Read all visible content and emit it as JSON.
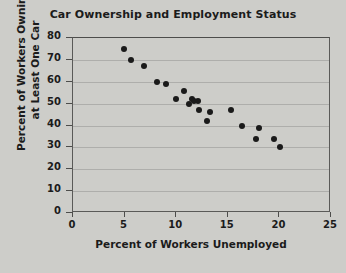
{
  "chart_data": {
    "type": "scatter",
    "title": "Car Ownership and Employment Status",
    "xlabel": "Percent of Workers Unemployed",
    "ylabel_line1": "Percent of Workers Owning",
    "ylabel_line2": "at Least One Car",
    "xlim": [
      0,
      25
    ],
    "ylim": [
      0,
      80
    ],
    "xticks": [
      0,
      5,
      10,
      15,
      20,
      25
    ],
    "yticks": [
      0,
      10,
      20,
      30,
      40,
      50,
      60,
      70,
      80
    ],
    "grid": "horizontal-faint",
    "legend": null,
    "marker": {
      "shape": "circle",
      "color": "#1a1a1a",
      "size_px": 6
    },
    "points": [
      {
        "x": 4.9,
        "y": 75
      },
      {
        "x": 5.6,
        "y": 70
      },
      {
        "x": 6.9,
        "y": 67
      },
      {
        "x": 8.1,
        "y": 60
      },
      {
        "x": 9.0,
        "y": 59
      },
      {
        "x": 10.0,
        "y": 52
      },
      {
        "x": 10.8,
        "y": 56
      },
      {
        "x": 11.2,
        "y": 50
      },
      {
        "x": 11.5,
        "y": 52
      },
      {
        "x": 11.7,
        "y": 51
      },
      {
        "x": 12.1,
        "y": 51
      },
      {
        "x": 12.2,
        "y": 47
      },
      {
        "x": 13.0,
        "y": 42
      },
      {
        "x": 13.3,
        "y": 46
      },
      {
        "x": 15.3,
        "y": 47
      },
      {
        "x": 16.4,
        "y": 40
      },
      {
        "x": 17.7,
        "y": 34
      },
      {
        "x": 18.0,
        "y": 39
      },
      {
        "x": 19.5,
        "y": 34
      },
      {
        "x": 20.1,
        "y": 30
      }
    ]
  },
  "colors": {
    "background": "#cdcdc9",
    "axis": "#4d4d4b",
    "text": "#1b1b1b",
    "marker": "#1a1a1a"
  }
}
